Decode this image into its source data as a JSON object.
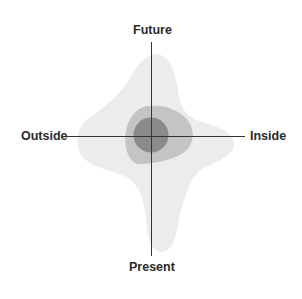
{
  "diagram": {
    "axes": {
      "top": "Future",
      "bottom": "Present",
      "left": "Outside",
      "right": "Inside"
    },
    "layers": [
      {
        "name": "outer",
        "color": "#ececec"
      },
      {
        "name": "middle",
        "color": "#c4c4c4"
      },
      {
        "name": "inner",
        "color": "#8a8a8a"
      }
    ],
    "axis_color": "#333333"
  }
}
